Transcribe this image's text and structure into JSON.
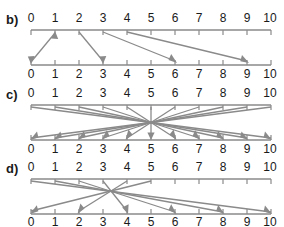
{
  "figure": {
    "title": "",
    "background_color": "#ffffff",
    "line_color": "#8a8a8a",
    "text_color": "#1a1a1a"
  },
  "panels": [
    {
      "id": "panel-b",
      "letter": "b)",
      "top_axis": {
        "min": 0,
        "max": 10,
        "ticks": [
          "0",
          "1",
          "2",
          "3",
          "4",
          "5",
          "6",
          "7",
          "8",
          "9",
          "10"
        ],
        "labels_position": "above"
      },
      "bottom_axis": {
        "min": 0,
        "max": 10,
        "ticks": [
          "0",
          "1",
          "2",
          "3",
          "4",
          "5",
          "6",
          "7",
          "8",
          "9",
          "10"
        ],
        "labels_position": "below"
      },
      "mappings": [
        {
          "from": 0,
          "to": 1,
          "direction": "up",
          "double_headed": true
        },
        {
          "from": 2,
          "to": 3,
          "direction": "down",
          "double_headed": false
        },
        {
          "from": 3,
          "to": 6,
          "direction": "down",
          "double_headed": false
        },
        {
          "from": 4,
          "to": 9,
          "direction": "down",
          "double_headed": false
        }
      ]
    },
    {
      "id": "panel-c",
      "letter": "c)",
      "top_axis": {
        "min": 0,
        "max": 10,
        "ticks": [
          "0",
          "1",
          "2",
          "3",
          "4",
          "5",
          "6",
          "7",
          "8",
          "9",
          "10"
        ],
        "labels_position": "above"
      },
      "bottom_axis": {
        "min": 0,
        "max": 10,
        "ticks": [
          "0",
          "1",
          "2",
          "3",
          "4",
          "5",
          "6",
          "7",
          "8",
          "9",
          "10"
        ],
        "labels_position": "below"
      },
      "center": 5,
      "mappings": [
        {
          "from": 0,
          "to": 10,
          "direction": "down",
          "double_headed": true
        },
        {
          "from": 1,
          "to": 9,
          "direction": "down",
          "double_headed": true
        },
        {
          "from": 2,
          "to": 8,
          "direction": "down",
          "double_headed": true
        },
        {
          "from": 3,
          "to": 7,
          "direction": "down",
          "double_headed": true
        },
        {
          "from": 4,
          "to": 6,
          "direction": "down",
          "double_headed": true
        },
        {
          "from": 5,
          "to": 5,
          "direction": "down",
          "double_headed": false
        },
        {
          "from": 6,
          "to": 4,
          "direction": "down",
          "double_headed": true
        },
        {
          "from": 7,
          "to": 3,
          "direction": "down",
          "double_headed": true
        },
        {
          "from": 8,
          "to": 2,
          "direction": "down",
          "double_headed": true
        },
        {
          "from": 9,
          "to": 1,
          "direction": "down",
          "double_headed": true
        },
        {
          "from": 10,
          "to": 0,
          "direction": "down",
          "double_headed": true
        }
      ]
    },
    {
      "id": "panel-d",
      "letter": "d)",
      "top_axis": {
        "min": 0,
        "max": 10,
        "ticks": [
          "0",
          "1",
          "2",
          "3",
          "4",
          "5",
          "6",
          "7",
          "8",
          "9",
          "10"
        ],
        "labels_position": "above"
      },
      "bottom_axis": {
        "min": 0,
        "max": 10,
        "ticks": [
          "0",
          "1",
          "2",
          "3",
          "4",
          "5",
          "6",
          "7",
          "8",
          "9",
          "10"
        ],
        "labels_position": "below"
      },
      "center": 3.33,
      "mappings": [
        {
          "from": 0,
          "to": 10,
          "direction": "down",
          "double_headed": false
        },
        {
          "from": 1,
          "to": 8,
          "direction": "down",
          "double_headed": false
        },
        {
          "from": 2,
          "to": 6,
          "direction": "down",
          "double_headed": false
        },
        {
          "from": 3,
          "to": 4,
          "direction": "down",
          "double_headed": false
        },
        {
          "from": 4,
          "to": 2,
          "direction": "down",
          "double_headed": false
        },
        {
          "from": 5,
          "to": 0,
          "direction": "down",
          "double_headed": false
        }
      ]
    }
  ]
}
